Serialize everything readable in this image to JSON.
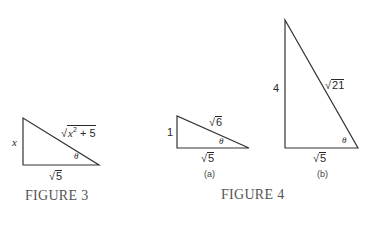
{
  "figure3": {
    "caption": "FIGURE 3",
    "side_vertical": "x",
    "hyp_radicand_base": "x",
    "hyp_radicand_exp": "2",
    "hyp_radicand_rest": " + 5",
    "base": "5",
    "angle": "θ"
  },
  "figure4": {
    "caption": "FIGURE 4",
    "a": {
      "sublabel": "(a)",
      "side_vertical": "1",
      "hyp": "6",
      "base": "5",
      "angle": "θ"
    },
    "b": {
      "sublabel": "(b)",
      "side_vertical": "4",
      "hyp": "21",
      "base": "5",
      "angle": "θ"
    }
  },
  "radical_sign": "√"
}
